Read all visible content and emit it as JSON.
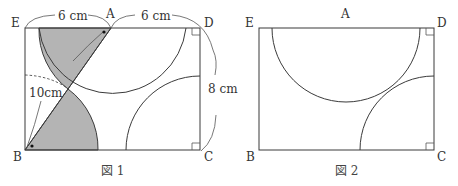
{
  "figure1": {
    "caption": "図 1",
    "labels": {
      "E": "E",
      "A": "A",
      "D": "D",
      "B": "B",
      "C": "C"
    },
    "dimensions": {
      "EA": "6 cm",
      "AD": "6 cm",
      "DC": "8 cm",
      "BA": "10cm"
    },
    "shade_color": "#b4b4b4"
  },
  "figure2": {
    "caption": "図 2",
    "labels": {
      "E": "E",
      "A": "A",
      "D": "D",
      "B": "B",
      "C": "C"
    }
  }
}
